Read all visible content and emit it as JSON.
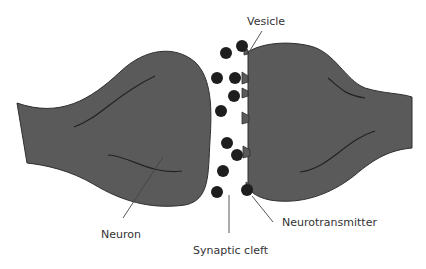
{
  "diagram": {
    "colors": {
      "neuron_fill": "#5a5a5a",
      "neuron_stroke": "#2e2e2e",
      "vesicle": "#1e1e1e",
      "label_text": "#333333",
      "leader_line": "#444444"
    },
    "labels": {
      "vesicle": "Vesicle",
      "neuron": "Neuron",
      "synaptic_cleft": "Synaptic cleft",
      "neurotransmitter": "Neurotransmitter"
    },
    "nodes": [
      {
        "id": "left-neuron",
        "type": "presynaptic-terminal"
      },
      {
        "id": "right-neuron",
        "type": "postsynaptic-terminal"
      },
      {
        "id": "synaptic-cleft",
        "type": "gap"
      }
    ],
    "vesicle_count": 11
  }
}
